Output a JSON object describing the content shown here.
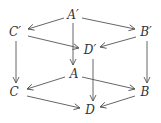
{
  "diagram": {
    "type": "commutative-cube",
    "line_color": "#555555",
    "text_color": "#333333",
    "nodes": [
      {
        "id": "Aprime",
        "label": "A′",
        "x": 73,
        "y": 15
      },
      {
        "id": "Cprime",
        "label": "C′",
        "x": 15,
        "y": 32
      },
      {
        "id": "Bprime",
        "label": "B′",
        "x": 146,
        "y": 32
      },
      {
        "id": "Dprime",
        "label": "D′",
        "x": 90,
        "y": 50
      },
      {
        "id": "A",
        "label": "A",
        "x": 74,
        "y": 74
      },
      {
        "id": "C",
        "label": "C",
        "x": 14,
        "y": 92
      },
      {
        "id": "B",
        "label": "B",
        "x": 145,
        "y": 92
      },
      {
        "id": "D",
        "label": "D",
        "x": 90,
        "y": 110
      }
    ],
    "edges": [
      {
        "from": "Aprime",
        "to": "Cprime",
        "x1": 64,
        "y1": 18,
        "x2": 28,
        "y2": 29
      },
      {
        "from": "Aprime",
        "to": "Bprime",
        "x1": 82,
        "y1": 18,
        "x2": 135,
        "y2": 29
      },
      {
        "from": "Cprime",
        "to": "Dprime",
        "x1": 28,
        "y1": 36,
        "x2": 79,
        "y2": 48
      },
      {
        "from": "Bprime",
        "to": "Dprime",
        "x1": 136,
        "y1": 37,
        "x2": 100,
        "y2": 47
      },
      {
        "from": "Aprime",
        "to": "A",
        "x1": 73,
        "y1": 23,
        "x2": 73,
        "y2": 65
      },
      {
        "from": "Cprime",
        "to": "C",
        "x1": 16,
        "y1": 41,
        "x2": 16,
        "y2": 83
      },
      {
        "from": "Bprime",
        "to": "B",
        "x1": 147,
        "y1": 41,
        "x2": 147,
        "y2": 83
      },
      {
        "from": "Dprime",
        "to": "D",
        "x1": 93,
        "y1": 59,
        "x2": 93,
        "y2": 101
      },
      {
        "from": "A",
        "to": "C",
        "x1": 65,
        "y1": 77,
        "x2": 27,
        "y2": 89
      },
      {
        "from": "A",
        "to": "B",
        "x1": 82,
        "y1": 77,
        "x2": 135,
        "y2": 89
      },
      {
        "from": "C",
        "to": "D",
        "x1": 27,
        "y1": 96,
        "x2": 80,
        "y2": 108
      },
      {
        "from": "B",
        "to": "D",
        "x1": 135,
        "y1": 96,
        "x2": 100,
        "y2": 107
      }
    ]
  }
}
